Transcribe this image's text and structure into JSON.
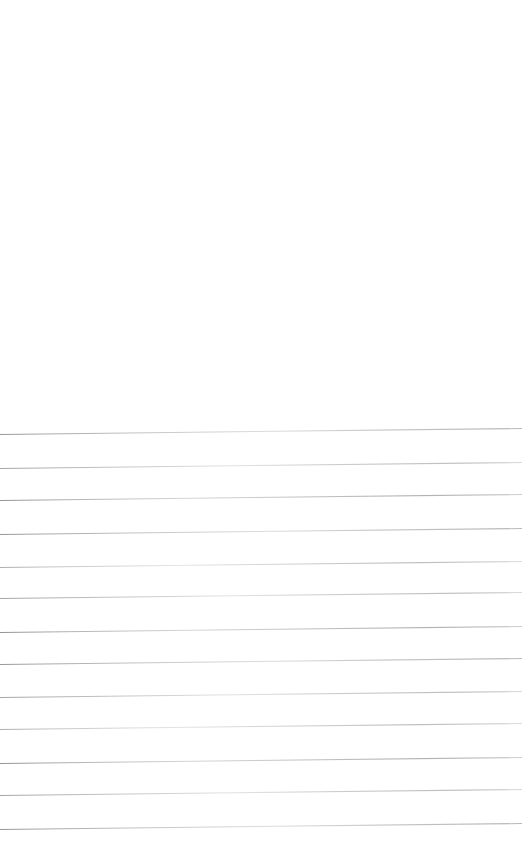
{
  "page": {
    "document_type": "scanned-ruled-paper",
    "width_px": 522,
    "height_px": 867,
    "background_color": "#ffffff",
    "written_content": "",
    "header_text": "",
    "footer_text": ""
  },
  "blank_margin": {
    "label": "",
    "top_px": 0,
    "height_px": 430
  },
  "rules": {
    "count": 13,
    "line_color": "#a9a9a9",
    "line_thickness_px": 1,
    "spacing_px": 32.9,
    "skew_degrees": -0.66,
    "first_line_y_px": 434,
    "last_line_y_px": 829,
    "left_inset_px": 0,
    "right_inset_px": 0,
    "lines": [
      {
        "index": 1,
        "y_px": 434,
        "shade": "v-a",
        "text": ""
      },
      {
        "index": 2,
        "y_px": 468,
        "shade": "v-b",
        "text": ""
      },
      {
        "index": 3,
        "y_px": 500,
        "shade": "v-c",
        "text": ""
      },
      {
        "index": 4,
        "y_px": 534,
        "shade": "v-a",
        "text": ""
      },
      {
        "index": 5,
        "y_px": 567,
        "shade": "v-d",
        "text": ""
      },
      {
        "index": 6,
        "y_px": 598,
        "shade": "v-b",
        "text": ""
      },
      {
        "index": 7,
        "y_px": 632,
        "shade": "v-c",
        "text": ""
      },
      {
        "index": 8,
        "y_px": 664,
        "shade": "v-a",
        "text": ""
      },
      {
        "index": 9,
        "y_px": 697,
        "shade": "v-b",
        "text": ""
      },
      {
        "index": 10,
        "y_px": 729,
        "shade": "v-d",
        "text": ""
      },
      {
        "index": 11,
        "y_px": 763,
        "shade": "v-c",
        "text": ""
      },
      {
        "index": 12,
        "y_px": 795,
        "shade": "v-b",
        "text": ""
      },
      {
        "index": 13,
        "y_px": 829,
        "shade": "v-a",
        "text": ""
      }
    ]
  }
}
